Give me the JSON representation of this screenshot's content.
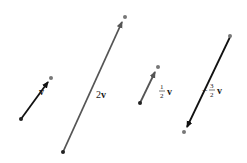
{
  "figure": {
    "vectors": [
      {
        "id": "v",
        "label": "v",
        "scalar": "1",
        "tail": [
          21,
          119
        ],
        "head": [
          50,
          79
        ],
        "stroke": "#111111",
        "label_pos": [
          39,
          93
        ]
      },
      {
        "id": "2v",
        "label_coef": "2",
        "label_vec": "v",
        "scalar": "2",
        "tail": [
          63,
          152
        ],
        "head": [
          124,
          18
        ],
        "stroke": "#555555",
        "label_pos": [
          97,
          96
        ]
      },
      {
        "id": "half-v",
        "frac_num": "1",
        "frac_den": "2",
        "label_vec": "v",
        "scalar": "1/2",
        "tail": [
          140,
          103
        ],
        "head": [
          157,
          68
        ],
        "stroke": "#555555",
        "label_pos": [
          159,
          92
        ]
      },
      {
        "id": "neg-three-halves-v",
        "sign": "−",
        "frac_num": "3",
        "frac_den": "2",
        "label_vec": "v",
        "scalar": "-3/2",
        "tail": [
          230,
          37
        ],
        "head": [
          185,
          131
        ],
        "stroke": "#111111",
        "label_pos": [
          210,
          90
        ]
      }
    ],
    "colors": {
      "tail_dot": "#222222",
      "head_dot": "#777777",
      "background": "#ffffff"
    }
  }
}
